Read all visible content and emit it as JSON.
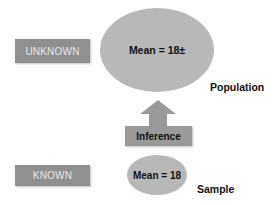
{
  "diagram": {
    "unknown_label": "UNKNOWN",
    "known_label": "KNOWN",
    "population": {
      "text": "Mean = 18±",
      "label": "Population"
    },
    "sample": {
      "text": "Mean = 18",
      "label": "Sample"
    },
    "inference_label": "Inference",
    "colors": {
      "box_fill": "#8f8f8f",
      "box_text": "#e8e8e8",
      "ellipse_fill": "#b8b8b8",
      "arrow_fill": "#9a9a9a",
      "text": "#111111"
    }
  }
}
